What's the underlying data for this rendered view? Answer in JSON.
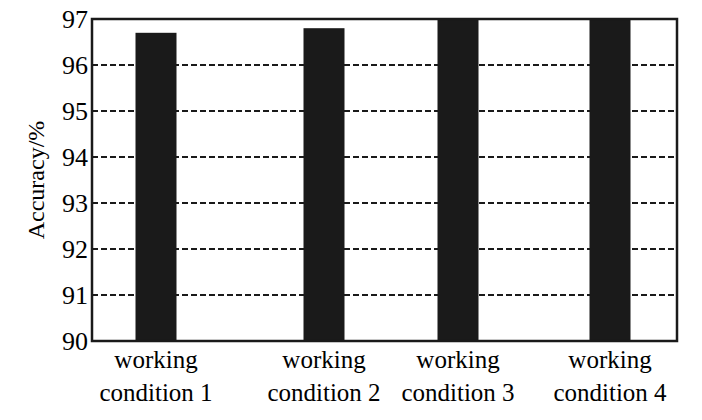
{
  "chart_data": {
    "type": "bar",
    "title": "",
    "xlabel": "",
    "ylabel": "Accuracy/%",
    "categories": [
      [
        "working",
        "condition 1"
      ],
      [
        "working",
        "condition 2"
      ],
      [
        "working",
        "condition 3"
      ],
      [
        "working",
        "condition 4"
      ]
    ],
    "category_labels": [
      "working condition 1",
      "working condition 2",
      "working condition 3",
      "working condition 4"
    ],
    "values": [
      96.7,
      96.8,
      97.0,
      97.0
    ],
    "ylim": [
      90,
      97
    ],
    "yticks": [
      90,
      91,
      92,
      93,
      94,
      95,
      96,
      97
    ],
    "grid": {
      "horizontal": true,
      "style": "dashed"
    },
    "legend": null,
    "bar_color": "#1a1a1a"
  }
}
